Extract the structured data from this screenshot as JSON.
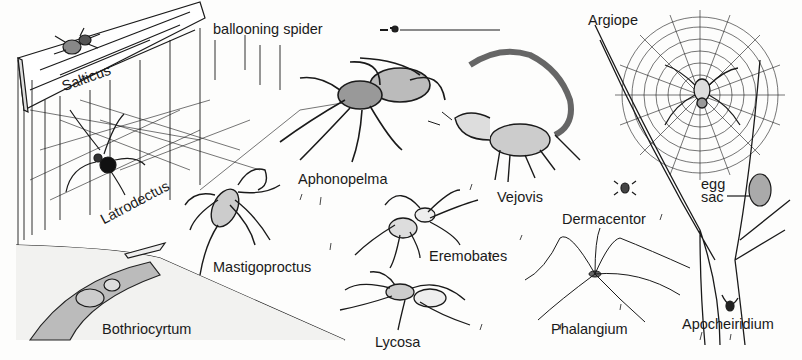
{
  "figure": {
    "type": "natural-history illustration",
    "ink_color": "#1a1a1a",
    "paper_color": "#fdfdfc"
  },
  "labels": {
    "salticus": "Salticus",
    "ballooning_spider": "ballooning spider",
    "latrodectus": "Latrodectus",
    "aphonopelma": "Aphonopelma",
    "vejovis": "Vejovis",
    "argiope": "Argiope",
    "egg": "egg",
    "sac": "sac",
    "mastigoproctus": "Mastigoproctus",
    "eremobates": "Eremobates",
    "dermacentor": "Dermacentor",
    "bothriocyrtum": "Bothriocyrtum",
    "lycosa": "Lycosa",
    "phalangium": "Phalangium",
    "apocheiridium": "Apocheiridium"
  }
}
